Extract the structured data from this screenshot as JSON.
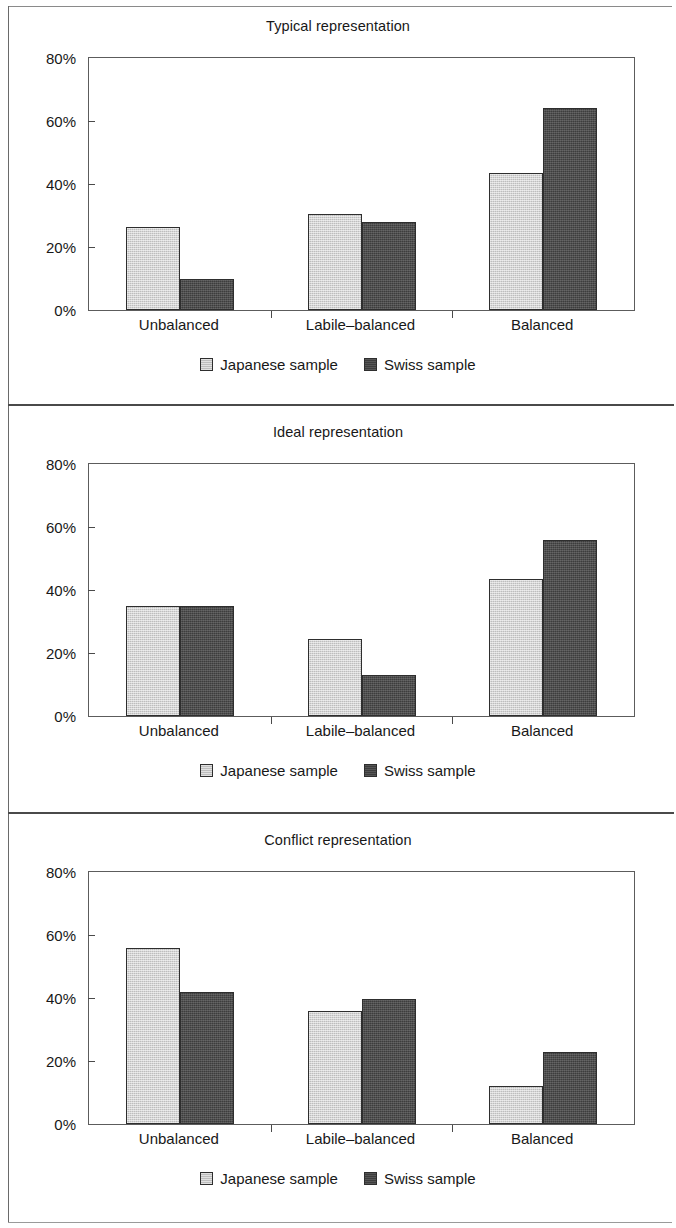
{
  "figure": {
    "panel_count": 3,
    "series_colors": {
      "japanese": "#bdbdbd",
      "swiss": "#3d3d3d"
    },
    "legend": {
      "japanese_label": "Japanese sample",
      "swiss_label": "Swiss sample"
    }
  },
  "chart_data": [
    {
      "type": "bar",
      "title": "Typical representation",
      "categories": [
        "Unbalanced",
        "Labile–balanced",
        "Balanced"
      ],
      "series": [
        {
          "name": "Japanese sample",
          "values": [
            26.5,
            30.5,
            43.5
          ]
        },
        {
          "name": "Swiss sample",
          "values": [
            10.0,
            28.0,
            64.0
          ]
        }
      ],
      "xlabel": "",
      "ylabel": "",
      "ylim": [
        0,
        80
      ],
      "yticks": [
        0,
        20,
        40,
        60,
        80
      ],
      "ytick_labels": [
        "0%",
        "20%",
        "40%",
        "60%",
        "80%"
      ],
      "grid": false,
      "legend_position": "bottom"
    },
    {
      "type": "bar",
      "title": "Ideal representation",
      "categories": [
        "Unbalanced",
        "Labile–balanced",
        "Balanced"
      ],
      "series": [
        {
          "name": "Japanese sample",
          "values": [
            34.8,
            24.5,
            43.5
          ]
        },
        {
          "name": "Swiss sample",
          "values": [
            34.8,
            13.0,
            56.0
          ]
        }
      ],
      "xlabel": "",
      "ylabel": "",
      "ylim": [
        0,
        80
      ],
      "yticks": [
        0,
        20,
        40,
        60,
        80
      ],
      "ytick_labels": [
        "0%",
        "20%",
        "40%",
        "60%",
        "80%"
      ],
      "grid": false,
      "legend_position": "bottom"
    },
    {
      "type": "bar",
      "title": "Conflict representation",
      "categories": [
        "Unbalanced",
        "Labile–balanced",
        "Balanced"
      ],
      "series": [
        {
          "name": "Japanese sample",
          "values": [
            56.0,
            36.0,
            12.0
          ]
        },
        {
          "name": "Swiss sample",
          "values": [
            42.0,
            39.8,
            23.0
          ]
        }
      ],
      "xlabel": "",
      "ylabel": "",
      "ylim": [
        0,
        80
      ],
      "yticks": [
        0,
        20,
        40,
        60,
        80
      ],
      "ytick_labels": [
        "0%",
        "20%",
        "40%",
        "60%",
        "80%"
      ],
      "grid": false,
      "legend_position": "bottom"
    }
  ]
}
